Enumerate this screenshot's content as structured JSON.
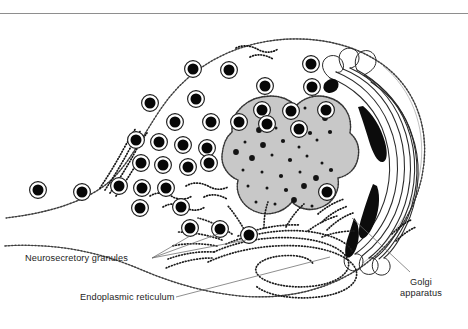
{
  "figure": {
    "kind": "cell-ultrastructure-diagram",
    "background_color": "#ffffff",
    "ink_color": "#111111",
    "nucleus_fill": "#c8c8c8",
    "border_line_color": "#8e8e8e"
  },
  "labels": {
    "neurosecretory_granules": "Neurosecretory granules",
    "endoplasmic_reticulum": "Endoplasmic reticulum",
    "golgi_line1": "Golgi",
    "golgi_line2": "apparatus"
  },
  "structures": {
    "cell_membrane": "cell-outline",
    "nucleus": "nucleus",
    "golgi": "golgi-apparatus",
    "rough_er": "rough-endoplasmic-reticulum",
    "granules": "neurosecretory-granules"
  },
  "counts": {
    "granules_visible": 34,
    "golgi_cisternae": 7,
    "nuclear_speckles": 42
  },
  "granules": [
    [
      193,
      69
    ],
    [
      229,
      70
    ],
    [
      265,
      86
    ],
    [
      196,
      99
    ],
    [
      312,
      87
    ],
    [
      150,
      103
    ],
    [
      262,
      110
    ],
    [
      291,
      111
    ],
    [
      326,
      110
    ],
    [
      175,
      122
    ],
    [
      211,
      122
    ],
    [
      239,
      122
    ],
    [
      267,
      124
    ],
    [
      299,
      129
    ],
    [
      136,
      140
    ],
    [
      159,
      142
    ],
    [
      183,
      145
    ],
    [
      207,
      148
    ],
    [
      141,
      163
    ],
    [
      163,
      165
    ],
    [
      188,
      167
    ],
    [
      209,
      163
    ],
    [
      119,
      186
    ],
    [
      142,
      188
    ],
    [
      166,
      188
    ],
    [
      38,
      190
    ],
    [
      82,
      192
    ],
    [
      140,
      208
    ],
    [
      181,
      207
    ],
    [
      190,
      228
    ],
    [
      220,
      229
    ],
    [
      249,
      235
    ],
    [
      327,
      192
    ],
    [
      311,
      64
    ]
  ],
  "nucleus_speckles": [
    [
      259,
      130
    ],
    [
      276,
      128
    ],
    [
      296,
      124
    ],
    [
      310,
      133
    ],
    [
      245,
      142
    ],
    [
      263,
      145
    ],
    [
      283,
      141
    ],
    [
      299,
      147
    ],
    [
      317,
      140
    ],
    [
      330,
      132
    ],
    [
      252,
      158
    ],
    [
      272,
      155
    ],
    [
      290,
      160
    ],
    [
      307,
      156
    ],
    [
      322,
      163
    ],
    [
      236,
      152
    ],
    [
      243,
      170
    ],
    [
      262,
      172
    ],
    [
      281,
      176
    ],
    [
      300,
      172
    ],
    [
      316,
      178
    ],
    [
      331,
      170
    ],
    [
      248,
      186
    ],
    [
      267,
      188
    ],
    [
      286,
      190
    ],
    [
      304,
      186
    ],
    [
      320,
      192
    ],
    [
      237,
      199
    ],
    [
      256,
      202
    ],
    [
      275,
      204
    ],
    [
      294,
      200
    ],
    [
      312,
      206
    ],
    [
      327,
      199
    ],
    [
      251,
      215
    ],
    [
      270,
      217
    ],
    [
      289,
      213
    ],
    [
      306,
      218
    ],
    [
      262,
      120
    ],
    [
      286,
      113
    ],
    [
      241,
      126
    ],
    [
      325,
      118
    ],
    [
      305,
      108
    ]
  ]
}
